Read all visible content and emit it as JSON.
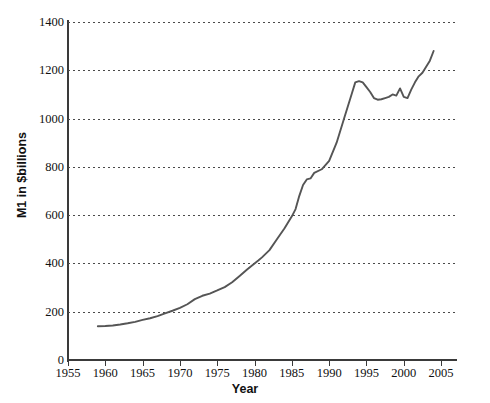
{
  "chart_data": {
    "type": "line",
    "title": "",
    "xlabel": "Year",
    "ylabel": "M1 in $billions",
    "xlim": [
      1955,
      2007
    ],
    "ylim": [
      0,
      1400
    ],
    "grid": true,
    "legend": "none",
    "xticks": [
      1955,
      1960,
      1965,
      1970,
      1975,
      1980,
      1985,
      1990,
      1995,
      2000,
      2005
    ],
    "yticks": [
      0,
      200,
      400,
      600,
      800,
      1000,
      1200,
      1400
    ],
    "line_color": "#555555",
    "series": [
      {
        "name": "M1 money stock",
        "x": [
          1959.0,
          1960.0,
          1961.0,
          1962.0,
          1963.0,
          1964.0,
          1965.0,
          1966.0,
          1967.0,
          1968.0,
          1969.0,
          1970.0,
          1971.0,
          1972.0,
          1973.0,
          1974.0,
          1975.0,
          1976.0,
          1977.0,
          1978.0,
          1979.0,
          1980.0,
          1980.5,
          1981.0,
          1982.0,
          1983.0,
          1984.0,
          1985.0,
          1985.5,
          1986.0,
          1986.5,
          1987.0,
          1987.5,
          1988.0,
          1989.0,
          1990.0,
          1991.0,
          1992.0,
          1993.0,
          1993.5,
          1994.0,
          1994.5,
          1995.0,
          1995.5,
          1996.0,
          1996.5,
          1997.0,
          1997.5,
          1998.0,
          1998.5,
          1999.0,
          1999.5,
          2000.0,
          2000.5,
          2001.0,
          2001.5,
          2002.0,
          2002.5,
          2003.0,
          2003.5,
          2004.0
        ],
        "y": [
          140,
          141,
          143,
          147,
          152,
          158,
          166,
          173,
          182,
          193,
          204,
          216,
          231,
          252,
          266,
          275,
          288,
          302,
          322,
          348,
          375,
          400,
          412,
          425,
          455,
          500,
          545,
          595,
          625,
          680,
          725,
          748,
          752,
          775,
          790,
          825,
          900,
          1000,
          1100,
          1150,
          1155,
          1150,
          1130,
          1110,
          1085,
          1078,
          1080,
          1085,
          1090,
          1100,
          1095,
          1125,
          1090,
          1085,
          1120,
          1150,
          1175,
          1190,
          1215,
          1240,
          1280
        ]
      }
    ]
  },
  "axes": {
    "y_title": "M1 in $billions",
    "x_title": "Year",
    "y_tick_labels": [
      "0",
      "200",
      "400",
      "600",
      "800",
      "1000",
      "1200",
      "1400"
    ],
    "x_tick_labels": [
      "1955",
      "1960",
      "1965",
      "1970",
      "1975",
      "1980",
      "1985",
      "1990",
      "1995",
      "2000",
      "2005"
    ]
  }
}
